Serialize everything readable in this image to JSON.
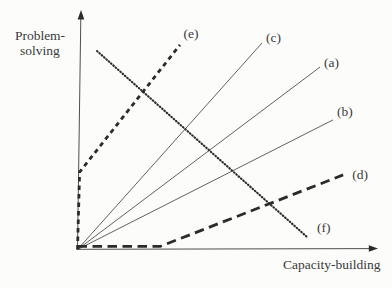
{
  "figure": {
    "background": "#fcfcfb",
    "colors": {
      "bold_ink": "#2b2b2b",
      "thin_ink": "#4f4f4f",
      "text": "#3a3a3a"
    }
  },
  "axes": {
    "y_label_line1": "Problem-",
    "y_label_line2": "solving",
    "x_label": "Capacity-building"
  },
  "chart_data": {
    "type": "line",
    "title": "",
    "xlabel": "Capacity-building",
    "ylabel": "Problem-solving",
    "xlim": [
      0,
      100
    ],
    "ylim": [
      0,
      100
    ],
    "grid": false,
    "axes_style": "arrow-tipped axes, no ticks, no numeric scale (conceptual plot)",
    "legend": "none (each line labeled inline at its upper end)",
    "series": [
      {
        "name": "(a)",
        "style": "thin-solid",
        "points": [
          [
            0,
            0
          ],
          [
            80.7,
            77.3
          ]
        ]
      },
      {
        "name": "(b)",
        "style": "thin-solid",
        "points": [
          [
            0,
            0
          ],
          [
            85.0,
            54.9
          ]
        ]
      },
      {
        "name": "(c)",
        "style": "thin-solid",
        "points": [
          [
            0,
            0
          ],
          [
            61.4,
            87.5
          ]
        ]
      },
      {
        "name": "(f)",
        "style": "fine-dotted",
        "points": [
          [
            6.5,
            84.1
          ],
          [
            76.4,
            5.3
          ]
        ]
      },
      {
        "name": "(d)",
        "style": "bold-long-dash",
        "points": [
          [
            0,
            1.3
          ],
          [
            27.5,
            1.3
          ],
          [
            88.4,
            31.6
          ]
        ]
      },
      {
        "name": "(e)",
        "style": "bold-short-dash",
        "points": [
          [
            0,
            0
          ],
          [
            0.7,
            32.8
          ],
          [
            34.1,
            86.7
          ]
        ]
      }
    ]
  }
}
